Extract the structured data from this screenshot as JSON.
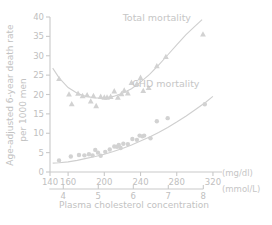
{
  "chart_data": {
    "type": "scatter",
    "title": "",
    "xlabel": "Plasma cholesterol concentration",
    "ylabel": "Age-adjusted 6-year death rate per 1000 men",
    "ylabel_line1": "Age-adjusted 6-year death rate",
    "ylabel_line2": "per 1000 men",
    "xunit_primary": "(mg/dl)",
    "xunit_secondary": "(mmol/L)",
    "xlim": [
      140,
      330
    ],
    "ylim": [
      0,
      40
    ],
    "xticks": [
      140,
      160,
      200,
      240,
      280,
      320
    ],
    "xticks_secondary": [
      4,
      5,
      6,
      7,
      8
    ],
    "yticks": [
      0,
      5,
      10,
      15,
      20,
      25,
      30,
      35,
      40
    ],
    "grid": false,
    "legend_position": "in-plot-annotations",
    "annotations": [
      {
        "text": "Total mortality",
        "x": 258,
        "y": 39
      },
      {
        "text": "CHD mortality",
        "x": 268,
        "y": 22
      }
    ],
    "series": [
      {
        "name": "Total mortality",
        "marker": "triangle",
        "color": "#d2d2d2",
        "points": [
          [
            150,
            24.1
          ],
          [
            161,
            20.1
          ],
          [
            164,
            17.6
          ],
          [
            171,
            20.3
          ],
          [
            176,
            19.7
          ],
          [
            181,
            19.9
          ],
          [
            185,
            18.3
          ],
          [
            188,
            19.7
          ],
          [
            191,
            17.1
          ],
          [
            196,
            19.5
          ],
          [
            200,
            19.3
          ],
          [
            203,
            19.3
          ],
          [
            207,
            19.5
          ],
          [
            211,
            20.9
          ],
          [
            215,
            19.3
          ],
          [
            219,
            20.2
          ],
          [
            222,
            21.1
          ],
          [
            226,
            20.4
          ],
          [
            230,
            23.1
          ],
          [
            236,
            22.8
          ],
          [
            240,
            24.4
          ],
          [
            243,
            21.0
          ],
          [
            249,
            21.8
          ],
          [
            258,
            27.4
          ],
          [
            268,
            29.8
          ],
          [
            309,
            35.6
          ]
        ],
        "fit_curve": [
          [
            143,
            26.8
          ],
          [
            150,
            24.3
          ],
          [
            160,
            21.8
          ],
          [
            170,
            20.3
          ],
          [
            180,
            19.5
          ],
          [
            190,
            19.1
          ],
          [
            200,
            19.1
          ],
          [
            210,
            19.5
          ],
          [
            220,
            20.3
          ],
          [
            230,
            21.5
          ],
          [
            240,
            23.2
          ],
          [
            250,
            25.2
          ],
          [
            260,
            27.6
          ],
          [
            270,
            30.2
          ],
          [
            280,
            32.8
          ],
          [
            290,
            35.4
          ],
          [
            300,
            37.6
          ],
          [
            308,
            39.3
          ]
        ]
      },
      {
        "name": "CHD mortality",
        "marker": "circle",
        "color": "#d2d2d2",
        "points": [
          [
            150,
            3.0
          ],
          [
            163,
            4.0
          ],
          [
            172,
            4.4
          ],
          [
            178,
            4.3
          ],
          [
            183,
            4.6
          ],
          [
            187,
            4.3
          ],
          [
            190,
            5.7
          ],
          [
            193,
            5.0
          ],
          [
            196,
            4.2
          ],
          [
            201,
            5.2
          ],
          [
            206,
            5.8
          ],
          [
            211,
            6.6
          ],
          [
            214,
            6.5
          ],
          [
            216,
            7.0
          ],
          [
            218,
            6.2
          ],
          [
            221,
            7.3
          ],
          [
            226,
            7.2
          ],
          [
            231,
            8.5
          ],
          [
            236,
            8.3
          ],
          [
            239,
            9.4
          ],
          [
            242,
            9.2
          ],
          [
            244,
            9.4
          ],
          [
            251,
            8.7
          ],
          [
            258,
            13.1
          ],
          [
            270,
            13.9
          ],
          [
            311,
            17.5
          ]
        ],
        "fit_curve": [
          [
            143,
            2.3
          ],
          [
            150,
            2.4
          ],
          [
            160,
            2.6
          ],
          [
            170,
            3.0
          ],
          [
            180,
            3.5
          ],
          [
            190,
            4.0
          ],
          [
            200,
            4.6
          ],
          [
            210,
            5.3
          ],
          [
            220,
            6.1
          ],
          [
            230,
            7.0
          ],
          [
            240,
            8.0
          ],
          [
            250,
            9.0
          ],
          [
            260,
            10.2
          ],
          [
            270,
            11.5
          ],
          [
            280,
            12.9
          ],
          [
            290,
            14.4
          ],
          [
            300,
            16.0
          ],
          [
            312,
            18.0
          ],
          [
            320,
            19.5
          ]
        ]
      }
    ]
  }
}
